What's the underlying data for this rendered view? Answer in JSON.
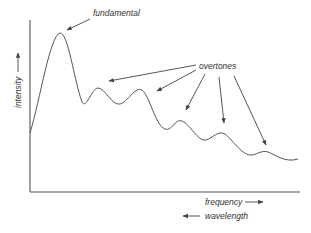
{
  "diagram": {
    "title": "",
    "y_axis_label": "intensity",
    "x_axis_labels": {
      "frequency": "frequency",
      "wavelength": "wavelength"
    },
    "annotations": {
      "fundamental": "fundamental",
      "overtones": "overtones"
    },
    "colors": {
      "line": "#555555",
      "text": "#333333",
      "background": "#ffffff"
    }
  }
}
